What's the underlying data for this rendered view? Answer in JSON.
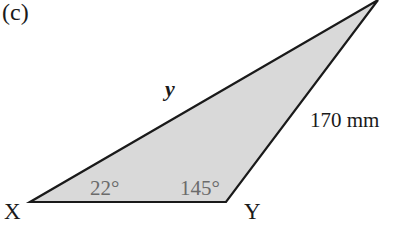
{
  "figure": {
    "part_label": "(c)",
    "shape": "triangle",
    "fill_color": "#d9d9d9",
    "stroke_color": "#1a1a1a",
    "vertices": {
      "X": {
        "label": "X",
        "x": 30,
        "y": 202
      },
      "Y": {
        "label": "Y",
        "x": 226,
        "y": 202
      },
      "Z": {
        "label": "",
        "x": 378,
        "y": 0
      }
    },
    "sides": {
      "XZ": {
        "label": "y"
      },
      "YZ": {
        "label": "170 mm"
      }
    },
    "angles": {
      "X": {
        "label": "22°"
      },
      "Y": {
        "label": "145°"
      }
    }
  }
}
